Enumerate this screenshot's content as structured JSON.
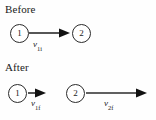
{
  "figure": {
    "type": "physics-collision-diagram",
    "background_color": "#fefefe",
    "stroke_color": "#2b2b2b",
    "text_color": "#1a1a1a"
  },
  "sections": {
    "before": {
      "heading": "Before",
      "balls": [
        {
          "label": "1",
          "cx": 19,
          "cy": 33
        },
        {
          "label": "2",
          "cx": 82,
          "cy": 33
        }
      ],
      "vectors": [
        {
          "symbol": "v",
          "subscript": "1i",
          "label_text": "v1i",
          "from_x": 29,
          "to_x": 70,
          "y": 33,
          "length": 41,
          "direction": "right"
        }
      ]
    },
    "after": {
      "heading": "After",
      "balls": [
        {
          "label": "1",
          "cx": 18,
          "cy": 93
        },
        {
          "label": "2",
          "cx": 76,
          "cy": 93
        }
      ],
      "vectors": [
        {
          "symbol": "v",
          "subscript": "1f",
          "label_text": "v1f",
          "from_x": 28,
          "to_x": 46,
          "y": 93,
          "length": 18,
          "direction": "right"
        },
        {
          "symbol": "v",
          "subscript": "2f",
          "label_text": "v2f",
          "from_x": 86,
          "to_x": 147,
          "y": 93,
          "length": 61,
          "direction": "right"
        }
      ]
    }
  }
}
